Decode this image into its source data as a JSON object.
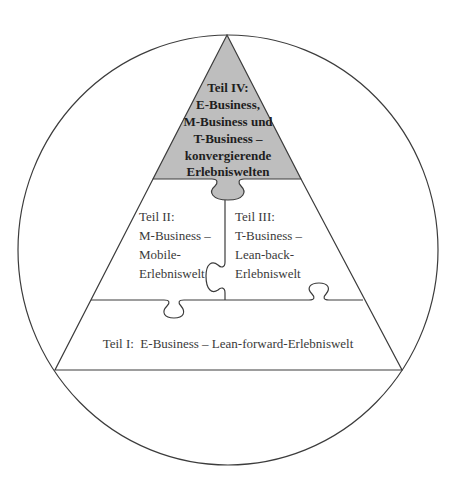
{
  "diagram": {
    "type": "pyramid-puzzle-in-circle",
    "colors": {
      "stroke": "#3c3c3c",
      "top_fill": "#bebebe",
      "background": "#ffffff"
    },
    "parts": [
      {
        "id": "teil-iv",
        "position": "top",
        "highlighted": true,
        "lines": [
          "Teil IV:",
          "E-Business,",
          "M-Business und",
          "T-Business –",
          "konvergierende",
          "Erlebniswelten"
        ]
      },
      {
        "id": "teil-ii",
        "position": "middle-left",
        "lines": [
          "Teil II:",
          "M-Business –",
          "Mobile-",
          "Erlebniswelt"
        ]
      },
      {
        "id": "teil-iii",
        "position": "middle-right",
        "lines": [
          "Teil III:",
          "T-Business –",
          "Lean-back-",
          "Erlebniswelt"
        ]
      },
      {
        "id": "teil-i",
        "position": "bottom",
        "lines": [
          "Teil I:  E-Business – Lean-forward-Erlebniswelt"
        ]
      }
    ]
  }
}
